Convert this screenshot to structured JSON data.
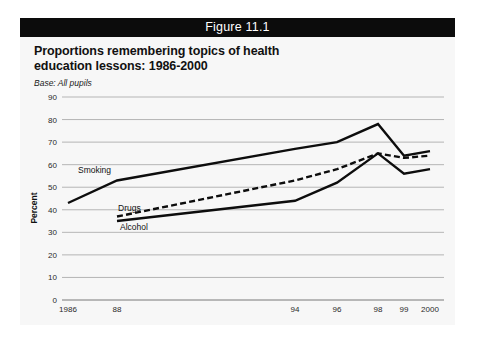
{
  "figure": {
    "header_label": "Figure 11.1",
    "title_line1": "Proportions remembering topics of health",
    "title_line2": "education lessons: 1986-2000",
    "base_note": "Base: All pupils"
  },
  "colors": {
    "header_background": "#0c0c0c",
    "header_text": "#ffffff",
    "panel_background": "#f7f7f7",
    "line_color": "#0d0d0d",
    "gridline_color": "#9a9a9a"
  },
  "series_labels": {
    "smoking": "Smoking",
    "drugs": "Drugs",
    "alcohol": "Alcohol"
  },
  "chart_data": {
    "type": "line",
    "title": "Proportions remembering topics of health education lessons: 1986-2000",
    "subtitle": "Base: All pupils",
    "xlabel": "",
    "ylabel": "Percent",
    "ylim": [
      0,
      90
    ],
    "ytick_labels": [
      "0",
      "10",
      "20",
      "30",
      "40",
      "50",
      "60",
      "70",
      "80",
      "90"
    ],
    "yticks": [
      0,
      10,
      20,
      30,
      40,
      50,
      60,
      70,
      80,
      90
    ],
    "grid": true,
    "legend": "inline-labels",
    "x": [
      1986,
      1988,
      1994,
      1996,
      1998,
      1999,
      2000
    ],
    "xtick_labels": [
      "1986",
      "88",
      "94",
      "96",
      "98",
      "99",
      "2000"
    ],
    "series": [
      {
        "name": "Smoking",
        "style": "solid",
        "x": [
          1986,
          1988,
          1994,
          1996,
          1998,
          1999,
          2000
        ],
        "values": [
          43,
          53,
          67,
          70,
          78,
          64,
          66
        ]
      },
      {
        "name": "Drugs",
        "style": "dashed",
        "x": [
          1988,
          1994,
          1996,
          1998,
          1999,
          2000
        ],
        "values": [
          37,
          53,
          58,
          65,
          63,
          64
        ]
      },
      {
        "name": "Alcohol",
        "style": "solid",
        "x": [
          1988,
          1994,
          1996,
          1998,
          1999,
          2000
        ],
        "values": [
          35,
          44,
          52,
          65,
          56,
          58
        ]
      }
    ]
  }
}
